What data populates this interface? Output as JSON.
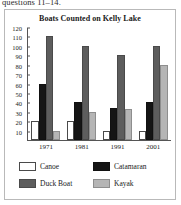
{
  "stem_text": "questions 11–14.",
  "chart_data": {
    "type": "bar",
    "title": "Boats Counted on Kelly Lake",
    "xlabel": "",
    "ylabel": "",
    "categories": [
      "1971",
      "1981",
      "1991",
      "2001"
    ],
    "ylim": [
      0,
      120
    ],
    "y_ticks": [
      120,
      110,
      100,
      90,
      80,
      70,
      60,
      50,
      40,
      30,
      20,
      10
    ],
    "grid": false,
    "legend_position": "bottom",
    "series": [
      {
        "name": "Canoe",
        "values": [
          20,
          20,
          10,
          10
        ],
        "color": "#ffffff"
      },
      {
        "name": "Catamaran",
        "values": [
          60,
          40,
          34,
          40
        ],
        "color": "#151515"
      },
      {
        "name": "Duck Boat",
        "values": [
          110,
          100,
          90,
          100
        ],
        "color": "#5d5d5d"
      },
      {
        "name": "Kayak",
        "values": [
          10,
          30,
          33,
          80
        ],
        "color": "#b5b5b5"
      }
    ]
  }
}
